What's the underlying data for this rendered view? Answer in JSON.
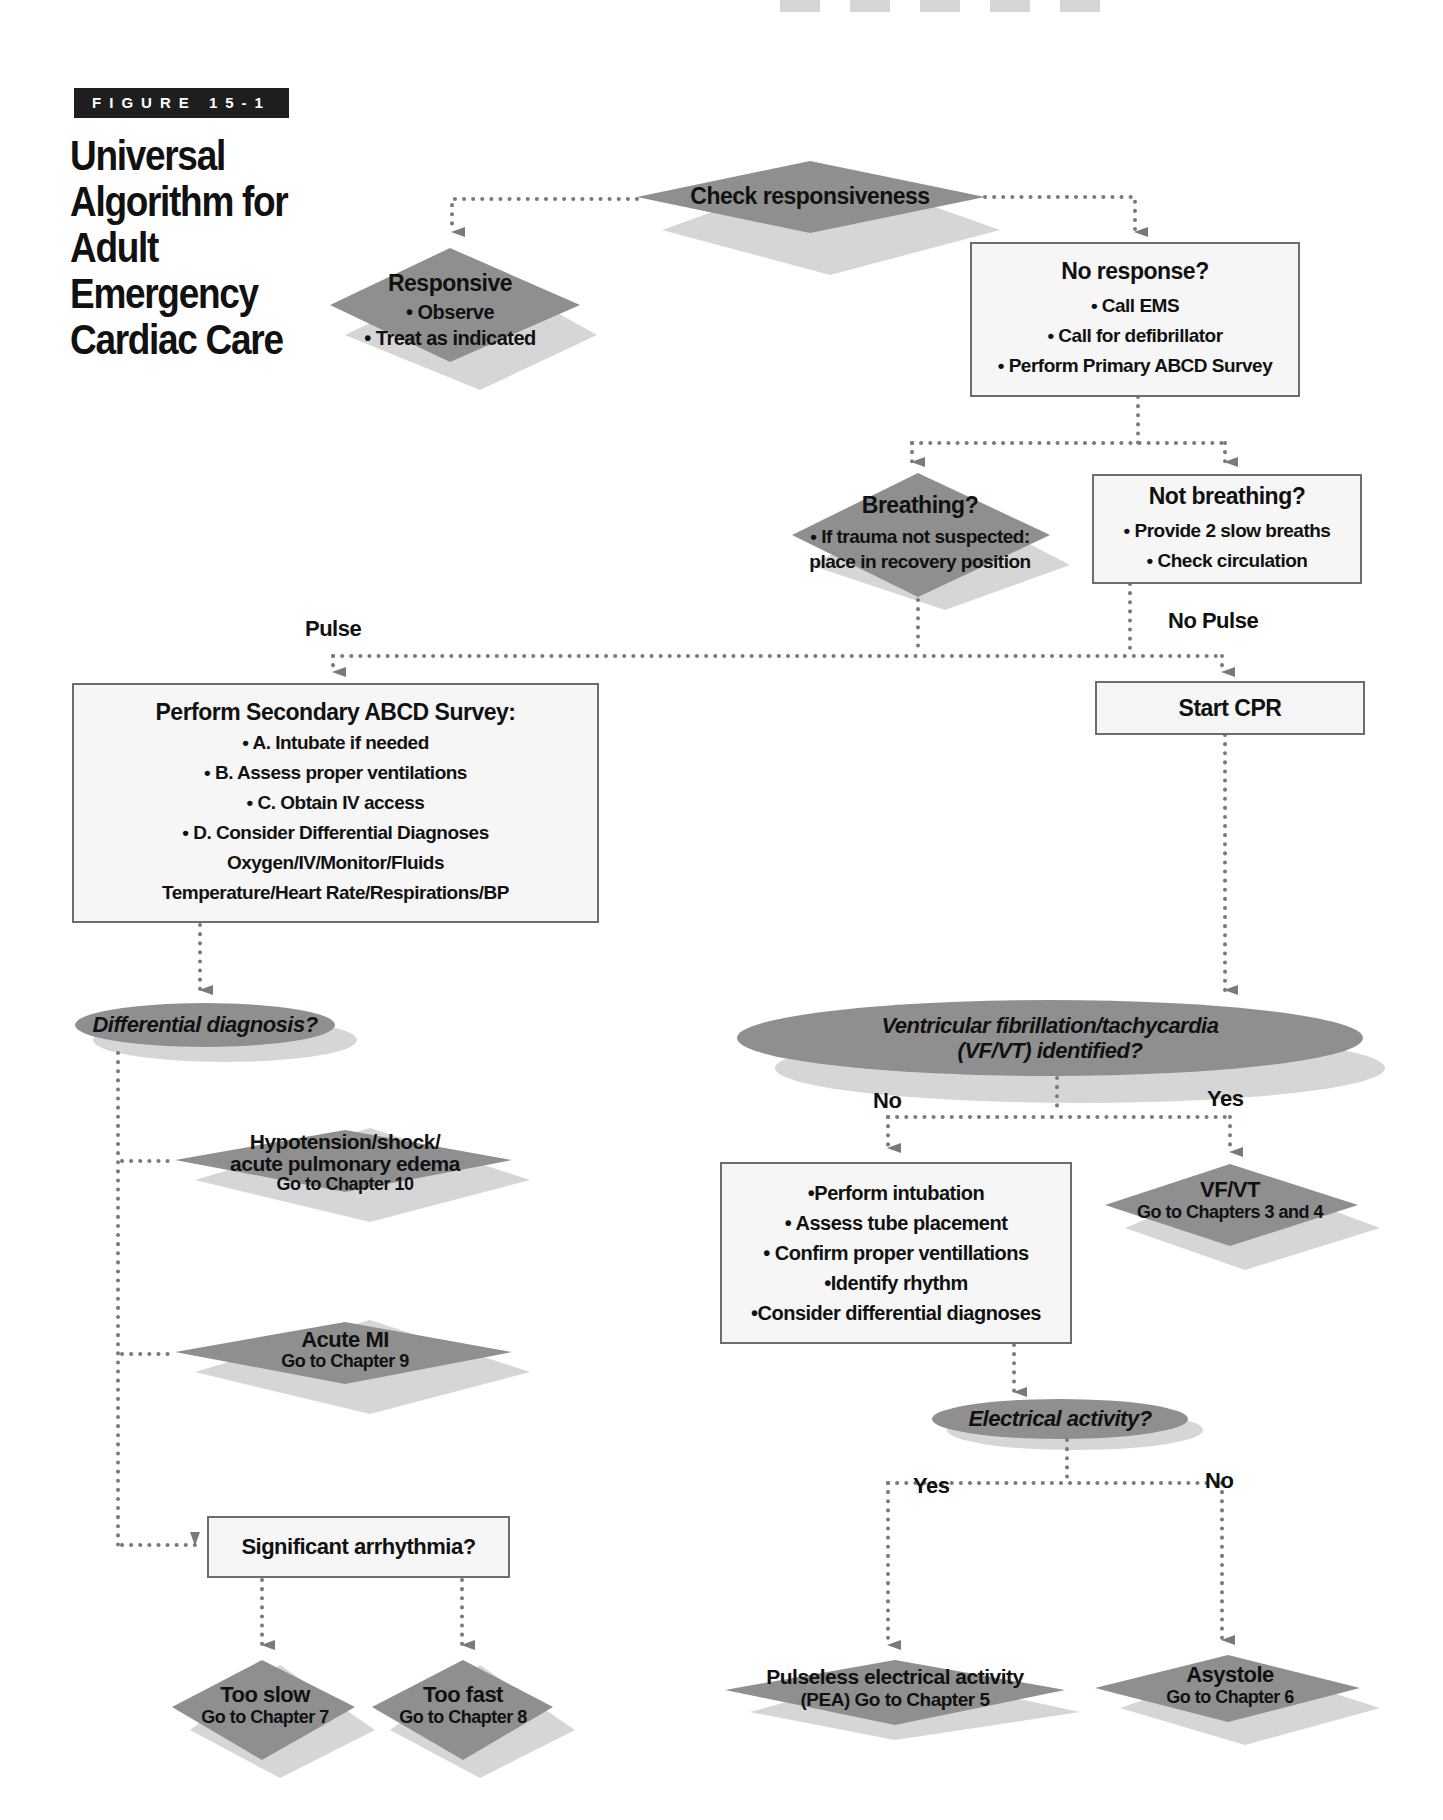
{
  "figure": {
    "tag": "FIGURE 15-1",
    "title_lines": [
      "Universal",
      "Algorithm for",
      "Adult Emergency",
      "Cardiac Care"
    ]
  },
  "colors": {
    "shape_fill": "#8f8f8f",
    "shadow_fill": "#d4d4d4",
    "box_fill": "#f6f6f6",
    "box_border": "#6d6d6d",
    "connector": "#7a7a7a",
    "tag_bg": "#1e1e1e"
  },
  "nodes": {
    "check_responsiveness": {
      "shape": "diamond",
      "title": "Check responsiveness"
    },
    "responsive": {
      "shape": "diamond",
      "title": "Responsive",
      "items": [
        "• Observe",
        "• Treat as indicated"
      ]
    },
    "no_response": {
      "shape": "box",
      "title": "No response?",
      "items": [
        "• Call EMS",
        "• Call for defibrillator",
        "• Perform Primary ABCD Survey"
      ]
    },
    "breathing": {
      "shape": "diamond",
      "title": "Breathing?",
      "items": [
        "• If trauma not suspected:",
        "place in recovery position"
      ]
    },
    "not_breathing": {
      "shape": "box",
      "title": "Not breathing?",
      "items": [
        "• Provide 2 slow breaths",
        "• Check circulation"
      ]
    },
    "secondary_survey": {
      "shape": "box",
      "title": "Perform Secondary ABCD Survey:",
      "items": [
        "• A. Intubate if needed",
        "• B. Assess proper ventilations",
        "• C. Obtain IV access",
        "• D. Consider Differential Diagnoses",
        "Oxygen/IV/Monitor/Fluids",
        "Temperature/Heart Rate/Respirations/BP"
      ]
    },
    "start_cpr": {
      "shape": "box",
      "title": "Start CPR"
    },
    "differential_diagnosis": {
      "shape": "ellipse",
      "title": "Differential diagnosis?"
    },
    "vf_vt_identified": {
      "shape": "ellipse",
      "title_lines": [
        "Ventricular fibrillation/tachycardia",
        "(VF/VT) identified?"
      ]
    },
    "hypotension": {
      "shape": "diamond",
      "lines": [
        "Hypotension/shock/",
        "acute pulmonary edema",
        "Go to Chapter 10"
      ]
    },
    "acute_mi": {
      "shape": "diamond",
      "lines": [
        "Acute MI",
        "Go to Chapter 9"
      ]
    },
    "vf_vt": {
      "shape": "diamond",
      "lines": [
        "VF/VT",
        "Go to Chapters 3 and 4"
      ]
    },
    "intubation": {
      "shape": "box",
      "items": [
        "•Perform intubation",
        "• Assess tube placement",
        "• Confirm proper ventillations",
        "•Identify rhythm",
        "•Consider differential diagnoses"
      ]
    },
    "electrical_activity": {
      "shape": "ellipse",
      "title": "Electrical activity?"
    },
    "significant_arrhythmia": {
      "shape": "box",
      "title": "Significant arrhythmia?"
    },
    "too_slow": {
      "shape": "diamond",
      "lines": [
        "Too slow",
        "Go to Chapter 7"
      ]
    },
    "too_fast": {
      "shape": "diamond",
      "lines": [
        "Too fast",
        "Go to Chapter 8"
      ]
    },
    "pea": {
      "shape": "diamond",
      "lines": [
        "Pulseless electrical activity",
        "(PEA) Go to Chapter 5"
      ]
    },
    "asystole": {
      "shape": "diamond",
      "lines": [
        "Asystole",
        "Go to Chapter 6"
      ]
    }
  },
  "edge_labels": {
    "pulse": "Pulse",
    "no_pulse": "No Pulse",
    "vf_no": "No",
    "vf_yes": "Yes",
    "ea_yes": "Yes",
    "ea_no": "No"
  }
}
